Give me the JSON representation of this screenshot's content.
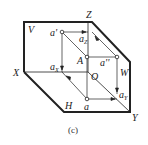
{
  "diagram": {
    "caption": "(c)",
    "planes": {
      "V": "V",
      "H": "H",
      "W": "W"
    },
    "axes": {
      "X": "X",
      "Y": "Y",
      "Z": "Z",
      "O": "O"
    },
    "points": {
      "A": "A",
      "a_prime": "a'",
      "a_double_prime": "a''",
      "a": "a"
    },
    "axis_points": {
      "aX": {
        "base": "a",
        "sub": "X"
      },
      "aY": {
        "base": "a",
        "sub": "Y"
      },
      "aZ": {
        "base": "a",
        "sub": "Z"
      }
    },
    "colors": {
      "line": "#222222",
      "background": "#ffffff"
    }
  }
}
